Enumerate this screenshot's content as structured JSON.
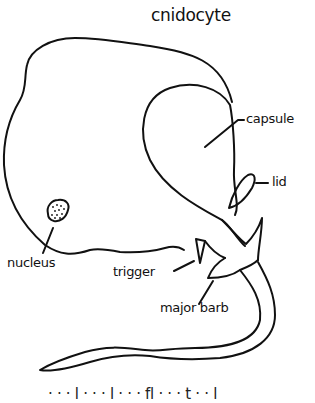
{
  "title": "cnidocyte",
  "labels": {
    "capsule": "capsule",
    "lid": "lid",
    "nucleus": "nucleus",
    "trigger": "trigger",
    "major_barb": "major barb"
  },
  "caption_partial": "· · · l · · · l · · ·  fl · · · t · · l",
  "colors": {
    "stroke": "#111111",
    "background": "#ffffff"
  }
}
